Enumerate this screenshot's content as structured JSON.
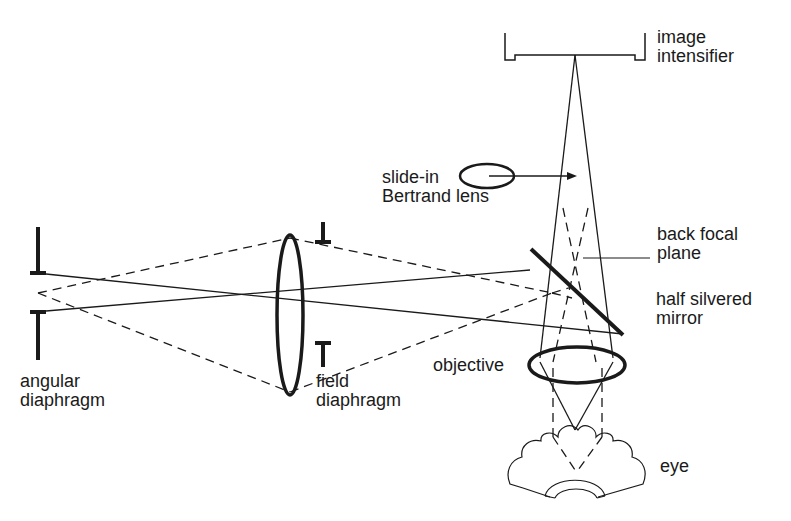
{
  "labels": {
    "image_intensifier": [
      "image",
      "intensifier"
    ],
    "bertrand_lens": [
      "slide-in",
      "Bertrand lens"
    ],
    "back_focal_plane": [
      "back focal",
      "plane"
    ],
    "half_silvered_mirror": [
      "half silvered",
      "mirror"
    ],
    "objective": "objective",
    "eye": "eye",
    "angular_diaphragm": [
      "angular",
      "diaphragm"
    ],
    "field_diaphragm": [
      "field",
      "diaphragm"
    ]
  },
  "colors": {
    "ink": "#1a1a1a",
    "background": "#ffffff"
  }
}
